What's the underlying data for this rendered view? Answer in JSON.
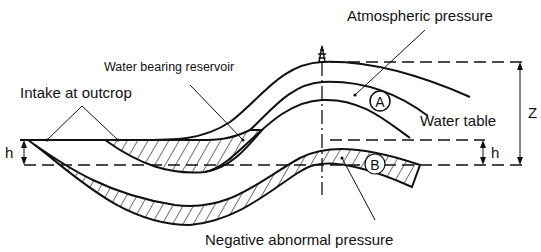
{
  "diagram": {
    "labels": {
      "atmospheric_pressure": "Atmospheric pressure",
      "water_bearing_reservoir": "Water bearing reservoir",
      "intake_at_outcrop": "Intake at outcrop",
      "water_table": "Water table",
      "negative_abnormal_pressure": "Negative abnormal pressure",
      "z": "Z",
      "h_left": "h",
      "h_right": "h",
      "point_a": "A",
      "point_b": "B"
    },
    "icons": {
      "well": "derrick-icon"
    },
    "colors": {
      "ink": "#111111",
      "background": "#ffffff"
    }
  }
}
